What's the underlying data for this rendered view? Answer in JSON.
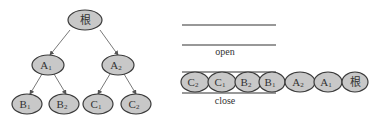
{
  "tree": {
    "root": {
      "label": "根",
      "sub": ""
    },
    "level1": [
      {
        "label": "A",
        "sub": "1"
      },
      {
        "label": "A",
        "sub": "2"
      }
    ],
    "level2": [
      {
        "label": "B",
        "sub": "1"
      },
      {
        "label": "B",
        "sub": "2"
      },
      {
        "label": "C",
        "sub": "1"
      },
      {
        "label": "C",
        "sub": "2"
      }
    ]
  },
  "lists": {
    "open_label": "open",
    "close_label": "close",
    "open_items": [],
    "close_items": [
      {
        "label": "C",
        "sub": "2"
      },
      {
        "label": "C",
        "sub": "1"
      },
      {
        "label": "B",
        "sub": "2"
      },
      {
        "label": "B",
        "sub": "1"
      },
      {
        "label": "A",
        "sub": "2"
      },
      {
        "label": "A",
        "sub": "1"
      },
      {
        "label": "根",
        "sub": ""
      }
    ]
  },
  "colors": {
    "node_fill": "#c8c8c8",
    "node_stroke": "#3a3a3a",
    "line": "#333333"
  }
}
